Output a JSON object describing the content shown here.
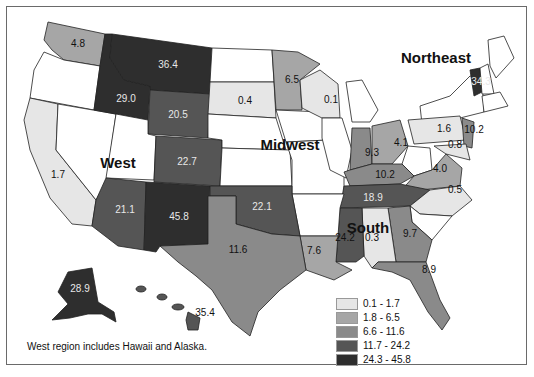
{
  "map": {
    "regions": {
      "west": "West",
      "midwest": "Midwest",
      "northeast": "Northeast",
      "south": "South"
    },
    "footnote": "West region includes Hawaii and Alaska.",
    "states": {
      "WA": "4.8",
      "MT": "36.4",
      "ID": "29.0",
      "WY": "20.5",
      "CO": "22.7",
      "CA": "1.7",
      "AZ": "21.1",
      "NM": "45.8",
      "AK": "28.9",
      "HI": "35.4",
      "SD": "0.4",
      "MN": "6.5",
      "WI": "0.1",
      "IN": "9.3",
      "OH": "4.1",
      "VT": "34.3",
      "PA": "1.6",
      "NJ": "10.2",
      "MD": "0.8",
      "VA": "4.0",
      "KY": "10.2",
      "TN": "18.9",
      "NC": "0.5",
      "OK": "22.1",
      "TX": "11.6",
      "LA": "7.6",
      "MS": "24.2",
      "AL": "0.3",
      "GA": "9.7",
      "FL": "8.9"
    }
  },
  "legend": {
    "items": [
      {
        "label": "0.1 - 1.7",
        "color": "#e6e6e6"
      },
      {
        "label": "1.8 - 6.5",
        "color": "#a6a6a6"
      },
      {
        "label": "6.6 - 11.6",
        "color": "#8a8a8a"
      },
      {
        "label": "11.7 - 24.2",
        "color": "#555555"
      },
      {
        "label": "24.3 - 45.8",
        "color": "#2e2e2e"
      }
    ]
  },
  "colors": {
    "none": "#ffffff",
    "c1": "#e6e6e6",
    "c2": "#a6a6a6",
    "c3": "#8a8a8a",
    "c4": "#555555",
    "c5": "#2e2e2e"
  }
}
